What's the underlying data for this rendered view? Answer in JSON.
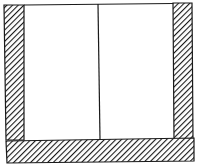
{
  "diagram": {
    "colors": {
      "stroke": "#1a1a1a",
      "fill": "#ffffff",
      "hatch": "#1a1a1a"
    },
    "parts": [
      {
        "name": "left-wall",
        "hatched": true
      },
      {
        "name": "right-wall",
        "hatched": true
      },
      {
        "name": "base-slab",
        "hatched": true
      },
      {
        "name": "top-line",
        "hatched": false
      },
      {
        "name": "center-divider",
        "hatched": false
      }
    ]
  }
}
